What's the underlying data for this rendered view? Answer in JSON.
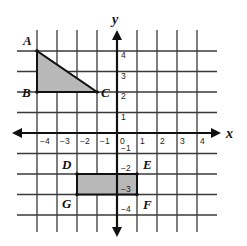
{
  "diagram": {
    "type": "coordinate-plane",
    "axes": {
      "x_label": "x",
      "y_label": "y",
      "x_range": [
        -4,
        4
      ],
      "y_range": [
        -4,
        4
      ],
      "x_ticks": [
        "-4",
        "-3",
        "-2",
        "-1",
        "0",
        "1",
        "2",
        "3",
        "4"
      ],
      "y_ticks": [
        "4",
        "3",
        "2",
        "1",
        "-1",
        "-2",
        "-3",
        "-4"
      ]
    },
    "shapes": [
      {
        "name": "triangle-ABC",
        "kind": "triangle",
        "fill": "#b8b8b8",
        "vertices": [
          {
            "label": "A",
            "x": -4,
            "y": 4
          },
          {
            "label": "B",
            "x": -4,
            "y": 2
          },
          {
            "label": "C",
            "x": -1,
            "y": 2
          }
        ]
      },
      {
        "name": "rectangle-DEFG",
        "kind": "rectangle",
        "fill": "#b8b8b8",
        "vertices": [
          {
            "label": "D",
            "x": -2,
            "y": -2
          },
          {
            "label": "E",
            "x": 1,
            "y": -2
          },
          {
            "label": "F",
            "x": 1,
            "y": -3
          },
          {
            "label": "G",
            "x": -2,
            "y": -3
          }
        ]
      }
    ],
    "colors": {
      "grid": "#3a3a3a",
      "axis": "#111111",
      "shape_fill": "#b8b8b8"
    }
  }
}
